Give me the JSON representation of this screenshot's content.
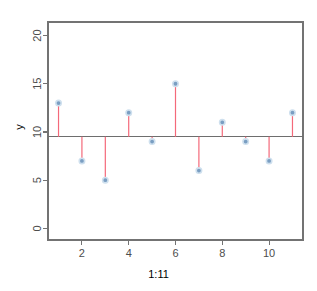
{
  "chart_data": {
    "type": "scatter",
    "subtype": "stem-plot",
    "title": "",
    "subtitle": "",
    "xlabel": "1:11",
    "ylabel": "y",
    "x": [
      1,
      2,
      3,
      4,
      5,
      6,
      7,
      8,
      9,
      10,
      11
    ],
    "values": [
      13,
      7,
      5,
      12,
      9,
      15,
      6,
      11,
      9,
      7,
      12
    ],
    "series": [
      {
        "name": "y",
        "values": [
          13,
          7,
          5,
          12,
          9,
          15,
          6,
          11,
          9,
          7,
          12
        ]
      }
    ],
    "baseline": 9.5,
    "xlim": [
      0.55,
      11.45
    ],
    "ylim": [
      -1.2,
      21.4
    ],
    "xticks": [
      2,
      4,
      6,
      8,
      10
    ],
    "xtick_labels": [
      "2",
      "4",
      "6",
      "8",
      "10"
    ],
    "yticks": [
      0,
      5,
      10,
      15,
      20
    ],
    "ytick_labels": [
      "0",
      "5",
      "10",
      "15",
      "20"
    ],
    "grid": false,
    "legend": false,
    "legend_position": "none",
    "colors": {
      "stem": "#f4697a",
      "point_fill": "#7a9ec2",
      "point_halo": "#cfe0ee",
      "axis": "#737373",
      "baseline": "#6e6e6e",
      "background": "#ffffff",
      "text": "#4d4d4d"
    },
    "annotations": []
  },
  "axes": {
    "y_title": "y",
    "x_title": "1:11"
  },
  "tick_text": {
    "y": [
      "20",
      "15",
      "10",
      "5",
      "0"
    ],
    "x": [
      "2",
      "4",
      "6",
      "8",
      "10"
    ]
  }
}
